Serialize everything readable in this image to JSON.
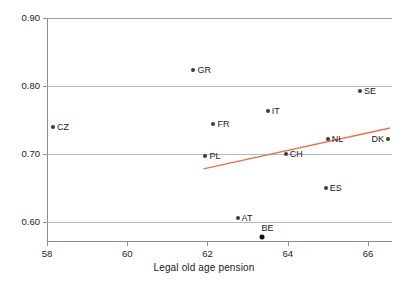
{
  "chart_data": {
    "type": "scatter",
    "title": "",
    "xlabel": "Legal old age pension",
    "ylabel": "",
    "xlim": [
      58,
      66.6
    ],
    "ylim": [
      0.5725,
      0.9
    ],
    "xticks": [
      58,
      60,
      62,
      64,
      66
    ],
    "xtick_labels": [
      "58",
      "60",
      "62",
      "64",
      "66"
    ],
    "yticks": [
      0.6,
      0.7,
      0.8,
      0.9
    ],
    "ytick_labels": [
      "0.60",
      "0.70",
      "0.80",
      "0.90"
    ],
    "grid": "horizontal",
    "legend": "none",
    "point_color": "#3a3a3a",
    "trend_color": "#e8714a",
    "grid_color": "#b9b9b9",
    "points": [
      {
        "label": "CZ",
        "x": 58.15,
        "y": 0.74,
        "label_pos": "right"
      },
      {
        "label": "GR",
        "x": 61.65,
        "y": 0.823,
        "label_pos": "right"
      },
      {
        "label": "PL",
        "x": 61.95,
        "y": 0.697,
        "label_pos": "right"
      },
      {
        "label": "FR",
        "x": 62.15,
        "y": 0.744,
        "label_pos": "right"
      },
      {
        "label": "AT",
        "x": 62.75,
        "y": 0.606,
        "label_pos": "right"
      },
      {
        "label": "BE",
        "x": 63.35,
        "y": 0.578,
        "label_pos": "above"
      },
      {
        "label": "IT",
        "x": 63.5,
        "y": 0.764,
        "label_pos": "right"
      },
      {
        "label": "CH",
        "x": 63.95,
        "y": 0.7,
        "label_pos": "right"
      },
      {
        "label": "ES",
        "x": 64.95,
        "y": 0.65,
        "label_pos": "right"
      },
      {
        "label": "NL",
        "x": 65.0,
        "y": 0.723,
        "label_pos": "right"
      },
      {
        "label": "SE",
        "x": 65.8,
        "y": 0.793,
        "label_pos": "right"
      },
      {
        "label": "DK",
        "x": 66.5,
        "y": 0.722,
        "label_pos": "left"
      }
    ],
    "trend_line": {
      "x_start": 61.9,
      "y_start": 0.6785,
      "x_end": 66.55,
      "y_end": 0.7385
    }
  }
}
